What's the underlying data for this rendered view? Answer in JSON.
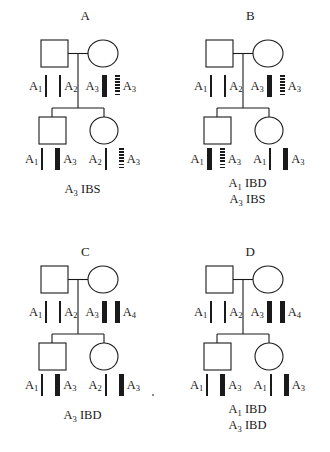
{
  "figure": {
    "symbols": {
      "male": "square",
      "female": "circle"
    },
    "bar_types": {
      "thin": "thin-solid-bar",
      "thick": "thick-solid-bar",
      "dotted": "dotted-hatched-bar"
    }
  },
  "panels": [
    {
      "id": "a",
      "letter": "A",
      "parent_row": [
        {
          "kind": "label",
          "allele": "A",
          "sub": "1"
        },
        {
          "kind": "bar",
          "style": "thin"
        },
        {
          "kind": "gap",
          "size": "md"
        },
        {
          "kind": "bar",
          "style": "thin"
        },
        {
          "kind": "label",
          "allele": "A",
          "sub": "2"
        },
        {
          "kind": "gap",
          "size": "sm"
        },
        {
          "kind": "label",
          "allele": "A",
          "sub": "3"
        },
        {
          "kind": "bar",
          "style": "thick"
        },
        {
          "kind": "gap",
          "size": "sm"
        },
        {
          "kind": "bar",
          "style": "dotted"
        },
        {
          "kind": "label",
          "allele": "A",
          "sub": "3"
        }
      ],
      "child_row": [
        {
          "kind": "label",
          "allele": "A",
          "sub": "1"
        },
        {
          "kind": "bar",
          "style": "thin"
        },
        {
          "kind": "gap",
          "size": "md"
        },
        {
          "kind": "bar",
          "style": "thick"
        },
        {
          "kind": "label",
          "allele": "A",
          "sub": "3"
        },
        {
          "kind": "gap",
          "size": "md"
        },
        {
          "kind": "label",
          "allele": "A",
          "sub": "2"
        },
        {
          "kind": "bar",
          "style": "thin"
        },
        {
          "kind": "gap",
          "size": "md"
        },
        {
          "kind": "bar",
          "style": "dotted"
        },
        {
          "kind": "label",
          "allele": "A",
          "sub": "3"
        }
      ],
      "caption": [
        {
          "allele": "A",
          "sub": "3",
          "status": "IBS"
        }
      ]
    },
    {
      "id": "b",
      "letter": "B",
      "parent_row": [
        {
          "kind": "label",
          "allele": "A",
          "sub": "1"
        },
        {
          "kind": "bar",
          "style": "thin"
        },
        {
          "kind": "gap",
          "size": "md"
        },
        {
          "kind": "bar",
          "style": "thin"
        },
        {
          "kind": "label",
          "allele": "A",
          "sub": "2"
        },
        {
          "kind": "gap",
          "size": "sm"
        },
        {
          "kind": "label",
          "allele": "A",
          "sub": "3"
        },
        {
          "kind": "bar",
          "style": "thick"
        },
        {
          "kind": "gap",
          "size": "sm"
        },
        {
          "kind": "bar",
          "style": "dotted"
        },
        {
          "kind": "label",
          "allele": "A",
          "sub": "3"
        }
      ],
      "child_row": [
        {
          "kind": "label",
          "allele": "A",
          "sub": "1"
        },
        {
          "kind": "bar",
          "style": "thick"
        },
        {
          "kind": "gap",
          "size": "sm"
        },
        {
          "kind": "bar",
          "style": "dotted"
        },
        {
          "kind": "label",
          "allele": "A",
          "sub": "3"
        },
        {
          "kind": "gap",
          "size": "md"
        },
        {
          "kind": "label",
          "allele": "A",
          "sub": "1"
        },
        {
          "kind": "bar",
          "style": "thin"
        },
        {
          "kind": "gap",
          "size": "md"
        },
        {
          "kind": "bar",
          "style": "thick"
        },
        {
          "kind": "label",
          "allele": "A",
          "sub": "3"
        }
      ],
      "caption": [
        {
          "allele": "A",
          "sub": "1",
          "status": "IBD"
        },
        {
          "allele": "A",
          "sub": "3",
          "status": "IBS"
        }
      ]
    },
    {
      "id": "c",
      "letter": "C",
      "parent_row": [
        {
          "kind": "label",
          "allele": "A",
          "sub": "1"
        },
        {
          "kind": "bar",
          "style": "thin"
        },
        {
          "kind": "gap",
          "size": "md"
        },
        {
          "kind": "bar",
          "style": "thin"
        },
        {
          "kind": "label",
          "allele": "A",
          "sub": "2"
        },
        {
          "kind": "gap",
          "size": "sm"
        },
        {
          "kind": "label",
          "allele": "A",
          "sub": "3"
        },
        {
          "kind": "bar",
          "style": "thick"
        },
        {
          "kind": "gap",
          "size": "sm"
        },
        {
          "kind": "bar",
          "style": "thick"
        },
        {
          "kind": "label",
          "allele": "A",
          "sub": "4"
        }
      ],
      "child_row": [
        {
          "kind": "label",
          "allele": "A",
          "sub": "1"
        },
        {
          "kind": "bar",
          "style": "thin"
        },
        {
          "kind": "gap",
          "size": "md"
        },
        {
          "kind": "bar",
          "style": "thick"
        },
        {
          "kind": "label",
          "allele": "A",
          "sub": "3"
        },
        {
          "kind": "gap",
          "size": "md"
        },
        {
          "kind": "label",
          "allele": "A",
          "sub": "2"
        },
        {
          "kind": "bar",
          "style": "thin"
        },
        {
          "kind": "gap",
          "size": "md"
        },
        {
          "kind": "bar",
          "style": "thick"
        },
        {
          "kind": "label",
          "allele": "A",
          "sub": "3"
        }
      ],
      "caption": [
        {
          "allele": "A",
          "sub": "3",
          "status": "IBD"
        }
      ]
    },
    {
      "id": "d",
      "letter": "D",
      "parent_row": [
        {
          "kind": "label",
          "allele": "A",
          "sub": "1"
        },
        {
          "kind": "bar",
          "style": "thin"
        },
        {
          "kind": "gap",
          "size": "md"
        },
        {
          "kind": "bar",
          "style": "thin"
        },
        {
          "kind": "label",
          "allele": "A",
          "sub": "2"
        },
        {
          "kind": "gap",
          "size": "sm"
        },
        {
          "kind": "label",
          "allele": "A",
          "sub": "3"
        },
        {
          "kind": "bar",
          "style": "thick"
        },
        {
          "kind": "gap",
          "size": "sm"
        },
        {
          "kind": "bar",
          "style": "thick"
        },
        {
          "kind": "label",
          "allele": "A",
          "sub": "4"
        }
      ],
      "child_row": [
        {
          "kind": "label",
          "allele": "A",
          "sub": "1"
        },
        {
          "kind": "bar",
          "style": "thin"
        },
        {
          "kind": "gap",
          "size": "md"
        },
        {
          "kind": "bar",
          "style": "thick"
        },
        {
          "kind": "label",
          "allele": "A",
          "sub": "3"
        },
        {
          "kind": "gap",
          "size": "md"
        },
        {
          "kind": "label",
          "allele": "A",
          "sub": "1"
        },
        {
          "kind": "bar",
          "style": "thin"
        },
        {
          "kind": "gap",
          "size": "md"
        },
        {
          "kind": "bar",
          "style": "thick"
        },
        {
          "kind": "label",
          "allele": "A",
          "sub": "3"
        }
      ],
      "caption": [
        {
          "allele": "A",
          "sub": "1",
          "status": "IBD"
        },
        {
          "allele": "A",
          "sub": "3",
          "status": "IBD"
        }
      ]
    }
  ]
}
